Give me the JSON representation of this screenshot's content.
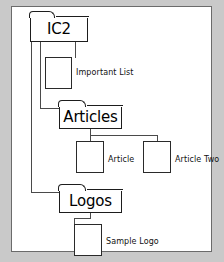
{
  "diagram": {
    "type": "tree",
    "root": {
      "id": "ic2",
      "kind": "folder",
      "label": "IC2"
    },
    "nodes": [
      {
        "id": "ic2",
        "kind": "folder",
        "label": "IC2",
        "parent": null,
        "depth": 0
      },
      {
        "id": "important",
        "kind": "document",
        "label": "Important List",
        "parent": "ic2",
        "depth": 1
      },
      {
        "id": "articles",
        "kind": "folder",
        "label": "Articles",
        "parent": "ic2",
        "depth": 1
      },
      {
        "id": "article",
        "kind": "document",
        "label": "Article",
        "parent": "articles",
        "depth": 2
      },
      {
        "id": "article-two",
        "kind": "document",
        "label": "Article Two",
        "parent": "articles",
        "depth": 2
      },
      {
        "id": "logos",
        "kind": "folder",
        "label": "Logos",
        "parent": "ic2",
        "depth": 1
      },
      {
        "id": "sample-logo",
        "kind": "document",
        "label": "Sample Logo",
        "parent": "logos",
        "depth": 2
      }
    ],
    "labels": {
      "ic2": "IC2",
      "important_list": "Important List",
      "articles": "Articles",
      "article": "Article",
      "article_two": "Article Two",
      "logos": "Logos",
      "sample_logo": "Sample Logo"
    },
    "colors": {
      "page_background": "#c9c9c9",
      "canvas_background": "#ffffff",
      "frame_border": "#6b6b6b",
      "folder_outline": "#1d1d1d",
      "document_outline": "#2a2a2a",
      "connector": "#4a4a4a",
      "text": "#000000"
    }
  }
}
